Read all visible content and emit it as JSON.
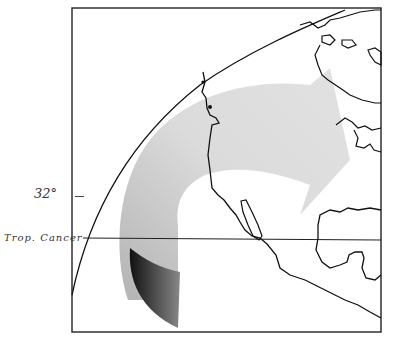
{
  "map": {
    "style": "hand-drawn pencil sketch",
    "region": "Western North America and eastern Pacific",
    "labels": {
      "latitude": "32°",
      "tropic": "Trop. Cancer"
    },
    "arrow": {
      "description": "Curved shaded arrow sweeping from the Pacific north-east across North America",
      "light_color": "#c8c8c8",
      "dark_color": "#1a1a1a"
    },
    "colors": {
      "line": "#111111",
      "background": "#ffffff"
    }
  }
}
